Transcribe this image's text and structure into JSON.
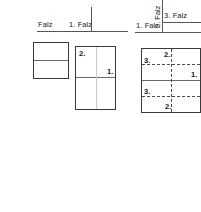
{
  "diagram": {
    "title": "Falz",
    "groups": [
      {
        "id": "group-1",
        "header_label": "Falz",
        "sheet": {
          "folds_solid_h": 1,
          "folds_solid_v": 0,
          "folds_dashed_h": 0,
          "folds_dashed_v": 0
        },
        "markers": []
      },
      {
        "id": "group-2",
        "header_label": "1. Falz",
        "sheet": {
          "folds_solid_h": 1,
          "folds_solid_v": 1,
          "folds_dashed_h": 0,
          "folds_dashed_v": 0
        },
        "markers": [
          {
            "text": "2.",
            "position": "top-left"
          },
          {
            "text": "1.",
            "position": "middle-right"
          }
        ]
      },
      {
        "id": "group-3",
        "header_labels": {
          "bottom_left": "1. Falz",
          "vertical": "2. Falz",
          "right": "3. Falz"
        },
        "sheet": {
          "folds_solid_h": 1,
          "folds_solid_v": 0,
          "folds_dashed_h": 2,
          "folds_dashed_v": 1
        },
        "markers": [
          {
            "text": "2.",
            "position": "top-center"
          },
          {
            "text": "3.",
            "position": "upper-left"
          },
          {
            "text": "1.",
            "position": "middle-right"
          },
          {
            "text": "3.",
            "position": "lower-left"
          },
          {
            "text": "2.",
            "position": "bottom-center"
          }
        ]
      }
    ]
  },
  "colors": {
    "sheet_border": "#3a3a3a",
    "fold_solid": "#6a6a6a",
    "fold_dashed": "#4a4a4a",
    "rule": "#555555",
    "text": "#1a1a1a",
    "background": "#ffffff"
  }
}
